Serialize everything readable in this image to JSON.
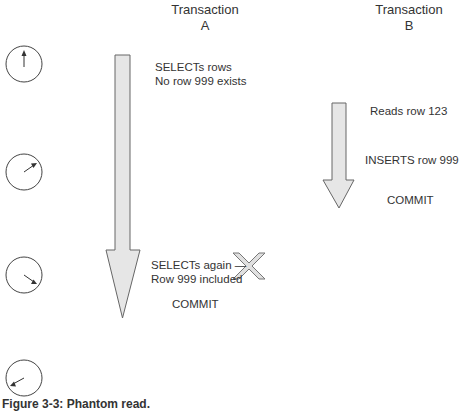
{
  "diagram": {
    "type": "sequence/timeline",
    "columns": [
      {
        "title": "Transaction",
        "sub": "A"
      },
      {
        "title": "Transaction",
        "sub": "B"
      }
    ],
    "transaction_a": {
      "step1": [
        "SELECTs rows",
        "No row 999 exists"
      ],
      "step2": [
        "SELECTs again —",
        "Row 999 included"
      ],
      "step3": "COMMIT"
    },
    "transaction_b": {
      "step1": "Reads row 123",
      "step2": "INSERTS row 999",
      "step3": "COMMIT"
    },
    "clocks": [
      {
        "hand": "12 o'clock"
      },
      {
        "hand": "2 o'clock"
      },
      {
        "hand": "4 o'clock"
      },
      {
        "hand": "8 o'clock"
      }
    ],
    "conflict_marker": "X",
    "caption": "Figure 3-3: Phantom read.",
    "colors": {
      "arrow_fill": "#e6e6e6",
      "stroke": "#555555",
      "cross_fill": "#d9d9d9"
    }
  }
}
